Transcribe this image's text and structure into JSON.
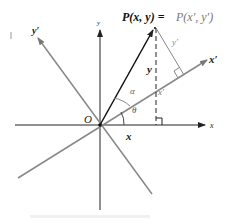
{
  "diagram": {
    "title_point_label": {
      "lhs": "P(x, y) = ",
      "rhs": "P(x′, y′)"
    },
    "axes": {
      "x": "x",
      "y": "y",
      "x_prime": "x′",
      "y_prime": "y′"
    },
    "origin": "O",
    "segment_labels": {
      "x": "x",
      "y": "y",
      "x_prime": "x′",
      "y_prime": "y′"
    },
    "angles": {
      "theta": "θ",
      "alpha": "α"
    },
    "colors": {
      "primary_axes": "#222222",
      "rotated_axes": "#8a8a8a",
      "vector": "#111111",
      "prime_text": "#777777"
    }
  }
}
